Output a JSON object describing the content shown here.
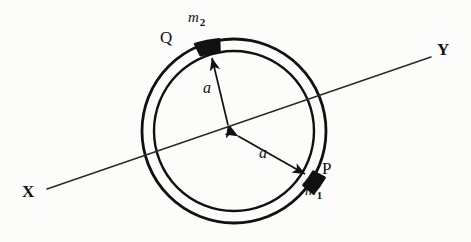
{
  "figure": {
    "kind": "physics-diagram",
    "background_color": "#fcfcfb",
    "ink_color": "#111111"
  },
  "geometry": {
    "center": {
      "x": 234,
      "y": 131
    },
    "outer_radius": 92,
    "inner_radius": 80,
    "ring_stroke_width": 2.6,
    "axis_line": {
      "x_end": {
        "x": 47,
        "y": 189
      },
      "y_end": {
        "x": 431,
        "y": 57
      },
      "stroke_width": 1.5
    },
    "mass_m1": {
      "angle_deg": 21,
      "x": 320,
      "y": 177
    },
    "mass_m2": {
      "angle_deg": 201,
      "x": 208,
      "y": 44
    }
  },
  "labels": {
    "axis_left": "X",
    "axis_right": "Y",
    "point_upper": "Q",
    "point_lower": "P",
    "mass_upper_symbol": "m",
    "mass_upper_subscript": "2",
    "mass_lower_symbol": "m",
    "mass_lower_subscript": "1",
    "radius_upper": "a",
    "radius_lower": "a"
  }
}
